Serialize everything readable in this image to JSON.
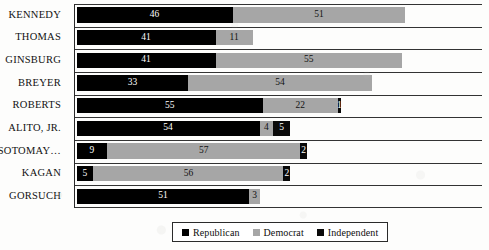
{
  "chart_data": {
    "type": "bar",
    "orientation": "horizontal",
    "stacked": true,
    "title": "",
    "subtitle": "",
    "xlabel": "",
    "ylabel": "",
    "grid": false,
    "xlim": [
      0,
      120
    ],
    "legend_position": "bottom-center",
    "categories": [
      "KENNEDY",
      "THOMAS",
      "GINSBURG",
      "BREYER",
      "ROBERTS",
      "ALITO, JR.",
      "SOTOMAY…",
      "KAGAN",
      "GORSUCH"
    ],
    "series": [
      {
        "name": "Republican",
        "color": "#000000",
        "values": [
          46,
          41,
          41,
          33,
          55,
          54,
          9,
          5,
          51
        ]
      },
      {
        "name": "Democrat",
        "color": "#a6a6a6",
        "values": [
          51,
          11,
          55,
          54,
          22,
          4,
          57,
          56,
          3
        ]
      },
      {
        "name": "Independent",
        "color": "#0a0a0a",
        "values": [
          0,
          0,
          0,
          0,
          1,
          5,
          2,
          2,
          0
        ]
      }
    ],
    "rows": [
      {
        "label": "KENNEDY",
        "republican": 46,
        "democrat": 51,
        "independent": 0
      },
      {
        "label": "THOMAS",
        "republican": 41,
        "democrat": 11,
        "independent": 0
      },
      {
        "label": "GINSBURG",
        "republican": 41,
        "democrat": 55,
        "independent": 0
      },
      {
        "label": "BREYER",
        "republican": 33,
        "democrat": 54,
        "independent": 0
      },
      {
        "label": "ROBERTS",
        "republican": 55,
        "democrat": 22,
        "independent": 1
      },
      {
        "label": "ALITO, JR.",
        "republican": 54,
        "democrat": 4,
        "independent": 5
      },
      {
        "label": "SOTOMAY…",
        "republican": 9,
        "democrat": 57,
        "independent": 2
      },
      {
        "label": "KAGAN",
        "republican": 5,
        "democrat": 56,
        "independent": 2
      },
      {
        "label": "GORSUCH",
        "republican": 51,
        "democrat": 3,
        "independent": 0
      }
    ]
  },
  "legend": {
    "items": [
      {
        "label": "Republican",
        "color": "#000000"
      },
      {
        "label": "Democrat",
        "color": "#a6a6a6"
      },
      {
        "label": "Independent",
        "color": "#0a0a0a"
      }
    ]
  }
}
